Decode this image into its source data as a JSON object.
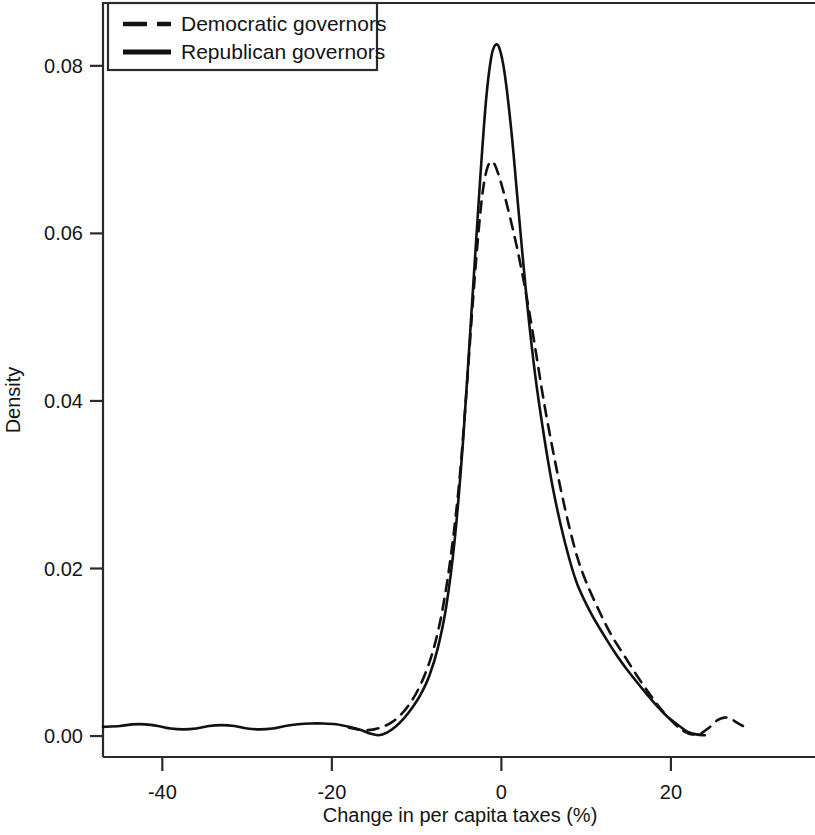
{
  "figure": {
    "background": "#ffffff",
    "ink_color": "#111111"
  },
  "legend": {
    "position": "top-left",
    "entries": [
      {
        "label": "Democratic governors",
        "style": "dashed"
      },
      {
        "label": "Republican governors",
        "style": "solid"
      }
    ]
  },
  "axes": {
    "x": {
      "title": "Change in per capita taxes (%)",
      "ticks": [
        "-40",
        "-20",
        "0",
        "20"
      ],
      "tick_values": [
        -40,
        -20,
        0,
        20
      ],
      "range": [
        -47,
        37
      ]
    },
    "y": {
      "title": "Density",
      "ticks": [
        "0.00",
        "0.02",
        "0.04",
        "0.06",
        "0.08"
      ],
      "tick_values": [
        0.0,
        0.02,
        0.04,
        0.06,
        0.08
      ],
      "range": [
        -0.0025,
        0.0875
      ]
    }
  },
  "chart_data": {
    "type": "line",
    "title": "",
    "subtitle": "",
    "xlabel": "Change in per capita taxes (%)",
    "ylabel": "Density",
    "xlim": [
      -47,
      37
    ],
    "ylim": [
      -0.0025,
      0.0875
    ],
    "grid": false,
    "legend_position": "top-left",
    "annotations": [],
    "series": [
      {
        "name": "Republican governors",
        "style": "solid",
        "color": "#111111",
        "points": [
          [
            -47.0,
            0.0011
          ],
          [
            -45.0,
            0.0012
          ],
          [
            -43.5,
            0.0014
          ],
          [
            -42.0,
            0.0014
          ],
          [
            -40.5,
            0.0012
          ],
          [
            -39.0,
            0.0009
          ],
          [
            -37.5,
            0.0008
          ],
          [
            -36.0,
            0.0009
          ],
          [
            -34.5,
            0.0012
          ],
          [
            -33.0,
            0.0013
          ],
          [
            -31.5,
            0.0012
          ],
          [
            -30.0,
            0.0009
          ],
          [
            -28.5,
            0.0008
          ],
          [
            -27.0,
            0.0009
          ],
          [
            -25.5,
            0.0012
          ],
          [
            -24.0,
            0.0014
          ],
          [
            -22.5,
            0.0015
          ],
          [
            -21.0,
            0.0015
          ],
          [
            -19.5,
            0.0014
          ],
          [
            -18.0,
            0.0011
          ],
          [
            -16.5,
            0.0007
          ],
          [
            -15.5,
            0.0003
          ],
          [
            -14.5,
            0.0001
          ],
          [
            -13.5,
            0.0004
          ],
          [
            -12.5,
            0.0011
          ],
          [
            -11.5,
            0.0021
          ],
          [
            -10.5,
            0.0034
          ],
          [
            -9.5,
            0.005
          ],
          [
            -8.5,
            0.0072
          ],
          [
            -7.5,
            0.0105
          ],
          [
            -6.5,
            0.0155
          ],
          [
            -5.5,
            0.0235
          ],
          [
            -4.5,
            0.0355
          ],
          [
            -3.5,
            0.051
          ],
          [
            -2.5,
            0.0665
          ],
          [
            -1.8,
            0.076
          ],
          [
            -1.2,
            0.081
          ],
          [
            -0.7,
            0.0825
          ],
          [
            -0.2,
            0.082
          ],
          [
            0.4,
            0.079
          ],
          [
            1.2,
            0.072
          ],
          [
            2.0,
            0.063
          ],
          [
            3.0,
            0.052
          ],
          [
            4.0,
            0.043
          ],
          [
            5.0,
            0.036
          ],
          [
            6.0,
            0.03
          ],
          [
            7.0,
            0.0252
          ],
          [
            8.0,
            0.0212
          ],
          [
            9.0,
            0.018
          ],
          [
            10.5,
            0.0148
          ],
          [
            12.0,
            0.0122
          ],
          [
            13.5,
            0.0098
          ],
          [
            15.0,
            0.0077
          ],
          [
            16.5,
            0.0058
          ],
          [
            18.0,
            0.004
          ],
          [
            19.5,
            0.0024
          ],
          [
            21.0,
            0.0012
          ],
          [
            22.0,
            0.0005
          ],
          [
            23.0,
            0.0002
          ],
          [
            24.0,
            0.0001
          ]
        ]
      },
      {
        "name": "Democratic governors",
        "style": "dashed",
        "color": "#111111",
        "points": [
          [
            -18.0,
            0.001
          ],
          [
            -17.0,
            0.0008
          ],
          [
            -16.0,
            0.0007
          ],
          [
            -15.0,
            0.0008
          ],
          [
            -14.0,
            0.0011
          ],
          [
            -13.0,
            0.0016
          ],
          [
            -12.0,
            0.0024
          ],
          [
            -11.0,
            0.0036
          ],
          [
            -10.0,
            0.0052
          ],
          [
            -9.0,
            0.0074
          ],
          [
            -8.0,
            0.0104
          ],
          [
            -7.0,
            0.0148
          ],
          [
            -6.0,
            0.0212
          ],
          [
            -5.0,
            0.03
          ],
          [
            -4.2,
            0.04
          ],
          [
            -3.5,
            0.05
          ],
          [
            -2.8,
            0.059
          ],
          [
            -2.2,
            0.065
          ],
          [
            -1.6,
            0.068
          ],
          [
            -1.0,
            0.0685
          ],
          [
            -0.4,
            0.0672
          ],
          [
            0.3,
            0.0648
          ],
          [
            1.0,
            0.062
          ],
          [
            1.8,
            0.0585
          ],
          [
            2.6,
            0.0545
          ],
          [
            3.4,
            0.05
          ],
          [
            4.2,
            0.045
          ],
          [
            5.0,
            0.04
          ],
          [
            6.0,
            0.0345
          ],
          [
            7.0,
            0.0295
          ],
          [
            8.0,
            0.025
          ],
          [
            9.0,
            0.0212
          ],
          [
            10.0,
            0.0184
          ],
          [
            11.5,
            0.015
          ],
          [
            13.0,
            0.012
          ],
          [
            14.5,
            0.0096
          ],
          [
            16.0,
            0.0072
          ],
          [
            17.5,
            0.005
          ],
          [
            19.0,
            0.003
          ],
          [
            20.5,
            0.0014
          ],
          [
            21.5,
            0.0006
          ],
          [
            22.5,
            0.0002
          ],
          [
            23.5,
            0.0003
          ],
          [
            24.5,
            0.001
          ],
          [
            25.5,
            0.0019
          ],
          [
            26.3,
            0.0022
          ],
          [
            27.0,
            0.0021
          ],
          [
            27.8,
            0.0016
          ],
          [
            28.5,
            0.0012
          ]
        ]
      }
    ]
  }
}
